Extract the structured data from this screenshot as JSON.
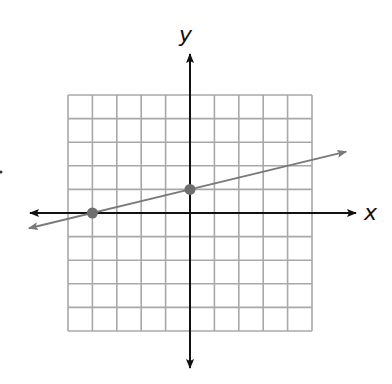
{
  "graph": {
    "x_axis_label": "x",
    "y_axis_label": "y",
    "grid": {
      "x_min": -5,
      "x_max": 5,
      "y_min": -5,
      "y_max": 5,
      "step": 1
    },
    "line": {
      "slope": 0.25,
      "y_intercept": 1,
      "equation": "y = 1/4 x + 1"
    },
    "points": [
      {
        "label": "x-intercept",
        "x": -4,
        "y": 0
      },
      {
        "label": "y-intercept",
        "x": 0,
        "y": 1
      }
    ],
    "colors": {
      "grid": "#a8a8a8",
      "axes": "#111111",
      "line": "#7a7a7a",
      "points": "#6e6e6e"
    }
  }
}
